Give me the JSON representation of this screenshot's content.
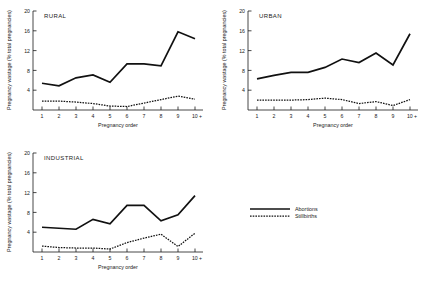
{
  "figure": {
    "legend": {
      "items": [
        {
          "label": "Abortions",
          "style": "solid"
        },
        {
          "label": "Stillbirths",
          "style": "dotted"
        }
      ]
    }
  },
  "chart_data": [
    {
      "type": "line",
      "title": "RURAL",
      "xlabel": "Pregnancy order",
      "ylabel": "Pregnancy wastage (% total pregnancies)",
      "categories": [
        "1",
        "2",
        "3",
        "4",
        "5",
        "6",
        "7",
        "8",
        "9",
        "10 +"
      ],
      "xticklabels": [
        "1",
        "2",
        "3",
        "4",
        "5",
        "6",
        "7",
        "8",
        "9",
        "10 +"
      ],
      "yticks": [
        4,
        8,
        12,
        16,
        20
      ],
      "yticklabels": [
        "4",
        "8",
        "12",
        "16",
        "20"
      ],
      "ylim": [
        0,
        20
      ],
      "grid": false,
      "legend_position": "figure-bottom-right",
      "series": [
        {
          "name": "Abortions",
          "values": [
            5.4,
            4.9,
            6.5,
            7.1,
            5.6,
            9.3,
            9.3,
            8.9,
            15.8,
            14.4
          ]
        },
        {
          "name": "Stillbirths",
          "values": [
            1.8,
            1.8,
            1.6,
            1.3,
            0.8,
            0.7,
            1.4,
            2.1,
            2.8,
            2.2
          ]
        }
      ]
    },
    {
      "type": "line",
      "title": "URBAN",
      "xlabel": "Pregnancy order",
      "ylabel": "Pregnancy wastage (% total pregnancies)",
      "categories": [
        "1",
        "2",
        "3",
        "4",
        "5",
        "6",
        "7",
        "8",
        "9",
        "10 +"
      ],
      "xticklabels": [
        "1",
        "2",
        "3",
        "4",
        "5",
        "6",
        "7",
        "8",
        "9",
        "10 +"
      ],
      "yticks": [
        4,
        8,
        12,
        16,
        20
      ],
      "yticklabels": [
        "4",
        "8",
        "12",
        "16",
        "20"
      ],
      "ylim": [
        0,
        20
      ],
      "grid": false,
      "legend_position": "figure-bottom-right",
      "series": [
        {
          "name": "Abortions",
          "values": [
            6.3,
            7.0,
            7.6,
            7.6,
            8.6,
            10.3,
            9.6,
            11.5,
            9.1,
            15.4
          ]
        },
        {
          "name": "Stillbirths",
          "values": [
            2.0,
            2.0,
            2.0,
            2.1,
            2.4,
            2.1,
            1.3,
            1.7,
            0.9,
            2.1
          ]
        }
      ]
    },
    {
      "type": "line",
      "title": "INDUSTRIAL",
      "xlabel": "Pregnancy order",
      "ylabel": "Pregnancy wastage (% total pregnancies)",
      "categories": [
        "1",
        "2",
        "3",
        "4",
        "5",
        "6",
        "7",
        "8",
        "9",
        "10 +"
      ],
      "xticklabels": [
        "1",
        "2",
        "3",
        "4",
        "5",
        "6",
        "7",
        "8",
        "9",
        "10 +"
      ],
      "yticks": [
        4,
        8,
        12,
        16,
        20
      ],
      "yticklabels": [
        "4",
        "8",
        "12",
        "16",
        "20"
      ],
      "ylim": [
        0,
        20
      ],
      "grid": false,
      "legend_position": "figure-bottom-right",
      "series": [
        {
          "name": "Abortions",
          "values": [
            5.0,
            4.8,
            4.6,
            6.6,
            5.7,
            9.4,
            9.4,
            6.3,
            7.5,
            11.4
          ]
        },
        {
          "name": "Stillbirths",
          "values": [
            1.2,
            0.9,
            0.8,
            0.8,
            0.6,
            1.9,
            2.8,
            3.6,
            1.1,
            3.8
          ]
        }
      ]
    }
  ]
}
